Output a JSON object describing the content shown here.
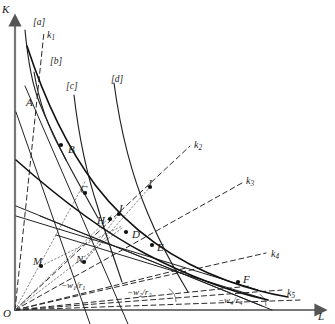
{
  "figure": {
    "type": "economics-isoquant-diagram",
    "width": 335,
    "height": 324,
    "background": "#ffffff",
    "ink": "#1a1a1a"
  },
  "axes": {
    "y_label": "K",
    "x_label": "L",
    "origin_label": "O",
    "origin": [
      15,
      310
    ],
    "y_top": [
      15,
      14
    ],
    "x_right": [
      327,
      310
    ]
  },
  "isoquant_labels": [
    {
      "name": "iso-label-a",
      "text": "[a]",
      "x": 33,
      "y": 18
    },
    {
      "name": "iso-label-b",
      "text": "[b]",
      "x": 50,
      "y": 57
    },
    {
      "name": "iso-label-c",
      "text": "[c]",
      "x": 66,
      "y": 82
    },
    {
      "name": "iso-label-d",
      "text": "[d]",
      "x": 111,
      "y": 75
    }
  ],
  "ray_labels": [
    {
      "name": "ray-label-k1",
      "base": "k",
      "sub": "1",
      "x": 47,
      "y": 30
    },
    {
      "name": "ray-label-k2",
      "base": "k",
      "sub": "2",
      "x": 194,
      "y": 140
    },
    {
      "name": "ray-label-k3",
      "base": "k",
      "sub": "3",
      "x": 246,
      "y": 176
    },
    {
      "name": "ray-label-k4",
      "base": "k",
      "sub": "4",
      "x": 271,
      "y": 249
    },
    {
      "name": "ray-label-k5",
      "base": "k",
      "sub": "5",
      "x": 287,
      "y": 288
    }
  ],
  "slope_labels": [
    {
      "name": "slope-label-w1r1",
      "text": "−w",
      "sub1": "1",
      "sep": "/r",
      "sub2": "1",
      "x": 61,
      "y": 281
    },
    {
      "name": "slope-label-w2r2",
      "text": "−w",
      "sub1": "2",
      "sep": "/r",
      "sub2": "2",
      "x": 127,
      "y": 288
    },
    {
      "name": "slope-label-w4r4",
      "text": "−w",
      "sub1": "4",
      "sep": "/r",
      "sub2": "4",
      "x": 218,
      "y": 296
    }
  ],
  "points": [
    {
      "name": "point-A",
      "label": "A",
      "x": 36,
      "y": 100,
      "lx": 26,
      "ly": 97,
      "dot": false
    },
    {
      "name": "point-B",
      "label": "B",
      "x": 61,
      "y": 145,
      "lx": 68,
      "ly": 144,
      "dot": true
    },
    {
      "name": "point-C",
      "label": "C",
      "x": 85,
      "y": 193,
      "lx": 80,
      "ly": 184,
      "dot": true
    },
    {
      "name": "point-D",
      "label": "D",
      "x": 126,
      "y": 232,
      "lx": 132,
      "ly": 229,
      "dot": true
    },
    {
      "name": "point-E",
      "label": "E",
      "x": 152,
      "y": 245,
      "lx": 157,
      "ly": 242,
      "dot": true
    },
    {
      "name": "point-F",
      "label": "F",
      "x": 238,
      "y": 282,
      "lx": 243,
      "ly": 274,
      "dot": true
    },
    {
      "name": "point-H",
      "label": "H",
      "x": 110,
      "y": 219,
      "lx": 97,
      "ly": 215,
      "dot": true
    },
    {
      "name": "point-I",
      "label": "I",
      "x": 119,
      "y": 214,
      "lx": 119,
      "ly": 203,
      "dot": true
    },
    {
      "name": "point-J",
      "label": "J",
      "x": 150,
      "y": 187,
      "lx": 147,
      "ly": 178,
      "dot": true
    },
    {
      "name": "point-M",
      "label": "M",
      "x": 41,
      "y": 266,
      "lx": 33,
      "ly": 256,
      "dot": true
    },
    {
      "name": "point-N",
      "label": "N",
      "x": 84,
      "y": 262,
      "lx": 76,
      "ly": 254,
      "dot": true
    }
  ],
  "isoquants": [
    {
      "name": "isoquant-a",
      "path": "M 25,30 C 28,62 32,85 40,104 C 48,124 56,140 66,160"
    },
    {
      "name": "isoquant-b",
      "path": "M 34,72 C 38,96 46,124 62,152 C 74,176 86,196 98,218"
    },
    {
      "name": "isoquant-c",
      "path": "M 74,95 C 78,130 86,172 98,208 C 106,236 114,258 122,282"
    },
    {
      "name": "isoquant-d",
      "path": "M 114,83 C 120,128 132,176 148,214 C 162,248 176,272 188,292"
    }
  ],
  "envelopes": [
    {
      "name": "envelope-upper",
      "path": "M 27,46 C 44,98 66,146 96,186 C 130,230 176,262 228,281 C 250,289 270,294 288,297"
    },
    {
      "name": "envelope-lower",
      "path": "M 16,160 C 52,192 96,228 146,254 C 190,277 232,292 268,300"
    }
  ],
  "tangent_lines": [
    {
      "name": "tangent-line-1",
      "x1": 16,
      "y1": 112,
      "x2": 90,
      "y2": 324
    },
    {
      "name": "tangent-line-2",
      "x1": 25,
      "y1": 86,
      "x2": 128,
      "y2": 324
    },
    {
      "name": "tangent-line-3",
      "x1": 16,
      "y1": 206,
      "x2": 272,
      "y2": 310
    },
    {
      "name": "tangent-line-4",
      "x1": 16,
      "y1": 216,
      "x2": 258,
      "y2": 290
    },
    {
      "name": "tangent-line-5",
      "x1": 40,
      "y1": 216,
      "x2": 262,
      "y2": 306
    },
    {
      "name": "tangent-line-6",
      "x1": 56,
      "y1": 235,
      "x2": 268,
      "y2": 300
    }
  ],
  "rays_dashed": [
    {
      "name": "ray-k1",
      "x1": 15,
      "y1": 310,
      "x2": 44,
      "y2": 32
    },
    {
      "name": "ray-k2",
      "x1": 15,
      "y1": 310,
      "x2": 190,
      "y2": 146
    },
    {
      "name": "ray-k3",
      "x1": 15,
      "y1": 310,
      "x2": 242,
      "y2": 183
    },
    {
      "name": "ray-k4",
      "x1": 15,
      "y1": 310,
      "x2": 266,
      "y2": 253
    },
    {
      "name": "ray-k5",
      "x1": 15,
      "y1": 310,
      "x2": 282,
      "y2": 290
    }
  ],
  "budget_dashed": [
    {
      "name": "budget-line-w1r1",
      "x1": 15,
      "y1": 310,
      "x2": 186,
      "y2": 268
    },
    {
      "name": "budget-line-w2r2",
      "x1": 15,
      "y1": 310,
      "x2": 250,
      "y2": 286
    },
    {
      "name": "budget-line-w4r4",
      "x1": 15,
      "y1": 310,
      "x2": 300,
      "y2": 300
    }
  ],
  "dotted_construction": [
    {
      "name": "construction-line-1",
      "x1": 15,
      "y1": 310,
      "x2": 86,
      "y2": 180
    },
    {
      "name": "construction-line-2",
      "x1": 15,
      "y1": 310,
      "x2": 112,
      "y2": 215
    },
    {
      "name": "construction-line-3",
      "x1": 15,
      "y1": 310,
      "x2": 122,
      "y2": 228
    },
    {
      "name": "construction-line-4",
      "x1": 41,
      "y1": 266,
      "x2": 122,
      "y2": 226
    },
    {
      "name": "construction-line-5",
      "x1": 84,
      "y1": 262,
      "x2": 120,
      "y2": 212
    },
    {
      "name": "construction-line-6",
      "x1": 84,
      "y1": 262,
      "x2": 150,
      "y2": 187
    }
  ],
  "angle_arcs": [
    {
      "name": "angle-arc-w2r2",
      "cx": 160,
      "cy": 302,
      "r": 16
    },
    {
      "name": "angle-arc-w4r4",
      "cx": 252,
      "cy": 306,
      "r": 14
    }
  ]
}
